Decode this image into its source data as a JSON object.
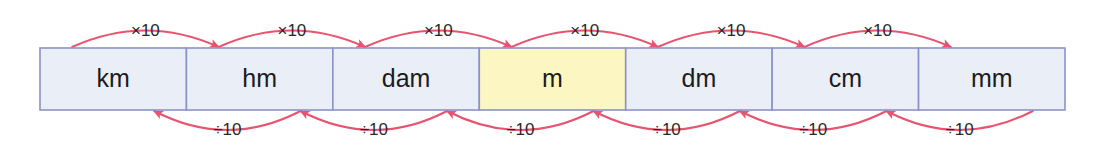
{
  "diagram": {
    "colors": {
      "background": "#ffffff",
      "cell_fill": "#eaeef7",
      "cell_fill_highlight": "#fbf6c2",
      "cell_border": "#8b93c4",
      "arrow": "#e8546f",
      "text": "#1c1c1c"
    },
    "bar": {
      "x": 40,
      "y": 48,
      "width": 1025,
      "height": 62
    },
    "cells": [
      {
        "id": "km",
        "label": "km",
        "highlighted": false
      },
      {
        "id": "hm",
        "label": "hm",
        "highlighted": false
      },
      {
        "id": "dam",
        "label": "dam",
        "highlighted": false
      },
      {
        "id": "m",
        "label": "m",
        "highlighted": true
      },
      {
        "id": "dm",
        "label": "dm",
        "highlighted": false
      },
      {
        "id": "cm",
        "label": "cm",
        "highlighted": false
      },
      {
        "id": "mm",
        "label": "mm",
        "highlighted": false
      }
    ],
    "top_arrows": [
      {
        "label": "×10",
        "from": "km",
        "to": "hm"
      },
      {
        "label": "×10",
        "from": "hm",
        "to": "dam"
      },
      {
        "label": "×10",
        "from": "dam",
        "to": "m"
      },
      {
        "label": "×10",
        "from": "m",
        "to": "dm"
      },
      {
        "label": "×10",
        "from": "dm",
        "to": "cm"
      },
      {
        "label": "×10",
        "from": "cm",
        "to": "mm"
      }
    ],
    "bottom_arrows": [
      {
        "label": "÷10",
        "from": "hm",
        "to": "km"
      },
      {
        "label": "÷10",
        "from": "dam",
        "to": "hm"
      },
      {
        "label": "÷10",
        "from": "m",
        "to": "dam"
      },
      {
        "label": "÷10",
        "from": "dm",
        "to": "m"
      },
      {
        "label": "÷10",
        "from": "cm",
        "to": "dm"
      },
      {
        "label": "÷10",
        "from": "mm",
        "to": "cm"
      }
    ]
  }
}
